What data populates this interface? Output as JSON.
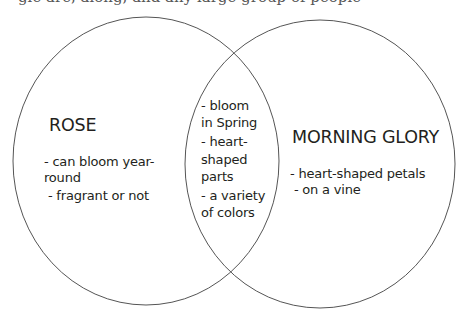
{
  "caption_fragment": "gle are, along, and any large group of people",
  "diagram": {
    "type": "venn",
    "stroke_color": "#555555",
    "left": {
      "title": "ROSE",
      "lines": [
        "- can bloom year-",
        "round",
        " - fragrant or not"
      ]
    },
    "overlap": {
      "lines": [
        "- bloom",
        "in Spring",
        "- heart-",
        "shaped",
        "parts",
        "- a variety",
        "of colors"
      ]
    },
    "right": {
      "title": "MORNING GLORY",
      "lines": [
        "- heart-shaped petals",
        " - on a vine"
      ]
    }
  }
}
